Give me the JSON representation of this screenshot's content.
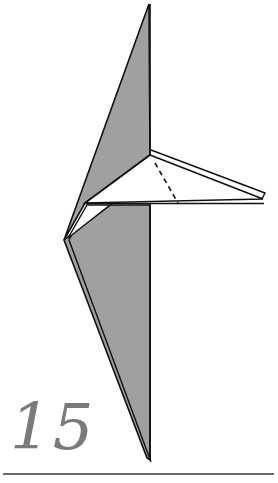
{
  "diagram": {
    "step_number": "15",
    "colors": {
      "paper_back": "#a0a0a0",
      "paper_front": "#ffffff",
      "line": "#111111",
      "step_number": "#7a7a7a",
      "rule": "#6a6a6a"
    },
    "elements": [
      {
        "id": "upper-gray-spike",
        "kind": "gray paper region"
      },
      {
        "id": "flap",
        "kind": "white folded flap pointing right"
      },
      {
        "id": "valley-fold-line",
        "kind": "dashed fold line"
      },
      {
        "id": "lower-white-triangle",
        "kind": "white paper region"
      },
      {
        "id": "lower-gray-spike",
        "kind": "gray paper region with double edge"
      }
    ]
  }
}
